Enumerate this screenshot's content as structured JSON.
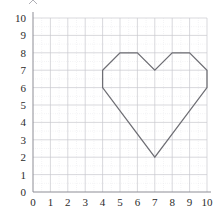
{
  "chart_data": {
    "type": "line",
    "title": "",
    "subtitle": "",
    "xlabel": "",
    "ylabel": "",
    "xlim": [
      0,
      10
    ],
    "ylim": [
      0,
      10
    ],
    "xticks": [
      0,
      1,
      2,
      3,
      4,
      5,
      6,
      7,
      8,
      9,
      10
    ],
    "yticks": [
      0,
      1,
      2,
      3,
      4,
      5,
      6,
      7,
      8,
      9,
      10
    ],
    "xticklabels": [
      "0",
      "1",
      "2",
      "3",
      "4",
      "5",
      "6",
      "7",
      "8",
      "9",
      "10"
    ],
    "yticklabels": [
      "0",
      "1",
      "2",
      "3",
      "4",
      "5",
      "6",
      "7",
      "8",
      "9",
      "10"
    ],
    "grid": true,
    "grid_major_step": 1,
    "grid_minor_step": 0.5,
    "legend": false,
    "legend_position": "none",
    "series": [
      {
        "name": "heart-polygon",
        "closed": true,
        "color": "#6e6e74",
        "points": [
          [
            4,
            6
          ],
          [
            4,
            7
          ],
          [
            5,
            8
          ],
          [
            6,
            8
          ],
          [
            7,
            7
          ],
          [
            8,
            8
          ],
          [
            9,
            8
          ],
          [
            10,
            7
          ],
          [
            10,
            6
          ],
          [
            7,
            2
          ],
          [
            4,
            6
          ]
        ]
      }
    ],
    "annotations": []
  },
  "colors": {
    "background": "#ffffff",
    "grid_major": "#c9c9cf",
    "grid_minor": "#d8d8de",
    "axis": "#8d8d95",
    "series_stroke": "#6e6e74",
    "tick_label": "#2b2b2b"
  },
  "plot_geometry": {
    "left_px": 33,
    "right_px": 207,
    "top_px": 18,
    "bottom_px": 192,
    "unit_px": 17.4
  }
}
